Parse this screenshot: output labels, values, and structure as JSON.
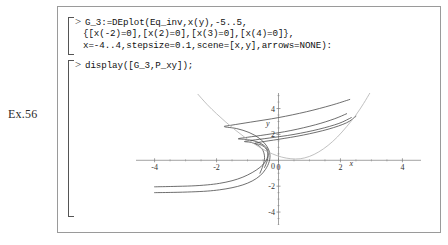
{
  "exercise": {
    "label": "Ex.56"
  },
  "worksheet": {
    "groups": [
      {
        "prompt": ">",
        "lines": [
          "G_3:=DEplot(Eq_inv,x(y),-5..5,",
          "{[x(-2)=0],[x(2)=0],[x(3)=0],[x(4)=0]},",
          "x=-4..4,stepsize=0.1,scene=[x,y],arrows=NONE):"
        ]
      },
      {
        "prompt": ">",
        "lines": [
          "display([G_3,P_xy]);"
        ]
      }
    ]
  },
  "chart_data": {
    "type": "line",
    "title": "",
    "xlabel": "x",
    "ylabel": "y",
    "xlim": [
      -4.6,
      4.6
    ],
    "ylim": [
      -5.0,
      5.2
    ],
    "grid": false,
    "legend": "none",
    "xticks": [
      -4,
      -2,
      0,
      2,
      4
    ],
    "xtick_labels": [
      "-4",
      "-2",
      "0",
      "2",
      "4"
    ],
    "yticks": [
      -4,
      -2,
      2,
      4
    ],
    "ytick_labels": [
      "-4",
      "-2",
      "2",
      "4"
    ],
    "axis_color": "#7a7a7a",
    "curve_color": "#4a4a4a",
    "highlight_color": "#b0b0b0",
    "series": [
      {
        "name": "x(-2)=0",
        "color": "#4a4a4a",
        "points": [
          [
            -4.0,
            -2.05
          ],
          [
            -3.4,
            -2.02
          ],
          [
            -2.8,
            -1.98
          ],
          [
            -2.3,
            -1.9
          ],
          [
            -1.9,
            -1.78
          ],
          [
            -1.5,
            -1.58
          ],
          [
            -1.15,
            -1.3
          ],
          [
            -0.85,
            -0.95
          ],
          [
            -0.6,
            -0.55
          ],
          [
            -0.42,
            -0.1
          ],
          [
            -0.34,
            0.4
          ],
          [
            -0.36,
            0.85
          ],
          [
            -0.5,
            1.2
          ],
          [
            -0.72,
            1.45
          ],
          [
            -1.0,
            1.6
          ],
          [
            -1.3,
            1.66
          ],
          [
            -1.0,
            1.78
          ],
          [
            -0.4,
            1.98
          ],
          [
            0.4,
            2.3
          ],
          [
            1.2,
            2.75
          ],
          [
            1.8,
            3.2
          ],
          [
            2.2,
            3.6
          ]
        ]
      },
      {
        "name": "x(2)=0",
        "color": "#4a4a4a",
        "points": [
          [
            -4.0,
            -2.5
          ],
          [
            -3.4,
            -2.48
          ],
          [
            -2.8,
            -2.44
          ],
          [
            -2.3,
            -2.38
          ],
          [
            -1.9,
            -2.28
          ],
          [
            -1.5,
            -2.12
          ],
          [
            -1.15,
            -1.9
          ],
          [
            -0.85,
            -1.6
          ],
          [
            -0.6,
            -1.2
          ],
          [
            -0.42,
            -0.7
          ],
          [
            -0.3,
            -0.1
          ],
          [
            -0.28,
            0.5
          ],
          [
            -0.38,
            1.1
          ],
          [
            -0.62,
            1.7
          ],
          [
            -0.95,
            2.15
          ],
          [
            -1.35,
            2.45
          ],
          [
            -1.75,
            2.6
          ],
          [
            -1.5,
            2.72
          ],
          [
            -0.9,
            2.95
          ],
          [
            0.0,
            3.3
          ],
          [
            0.9,
            3.75
          ],
          [
            1.7,
            4.25
          ],
          [
            2.3,
            4.7
          ]
        ]
      },
      {
        "name": "x(3)=0",
        "color": "#4a4a4a",
        "points": [
          [
            -0.6,
            -1.0
          ],
          [
            -0.5,
            -0.4
          ],
          [
            -0.45,
            0.2
          ],
          [
            -0.5,
            0.75
          ],
          [
            -0.65,
            1.15
          ],
          [
            -0.88,
            1.38
          ],
          [
            -1.1,
            1.45
          ],
          [
            -0.85,
            1.55
          ],
          [
            -0.3,
            1.72
          ],
          [
            0.5,
            2.0
          ],
          [
            1.3,
            2.4
          ],
          [
            1.95,
            2.85
          ],
          [
            2.35,
            3.3
          ]
        ]
      },
      {
        "name": "x(4)=0",
        "color": "#4a4a4a",
        "points": [
          [
            -0.45,
            -0.55
          ],
          [
            -0.36,
            0.0
          ],
          [
            -0.34,
            0.5
          ],
          [
            -0.42,
            0.95
          ],
          [
            -0.6,
            1.22
          ],
          [
            -0.78,
            1.3
          ],
          [
            -0.55,
            1.42
          ],
          [
            0.0,
            1.62
          ],
          [
            0.8,
            1.95
          ],
          [
            1.6,
            2.4
          ],
          [
            2.2,
            2.9
          ],
          [
            2.5,
            3.4
          ]
        ]
      },
      {
        "name": "P_xy",
        "color": "#b0b0b0",
        "points": [
          [
            -2.6,
            5.1
          ],
          [
            -2.3,
            4.3
          ],
          [
            -2.0,
            3.6
          ],
          [
            -1.7,
            2.95
          ],
          [
            -1.4,
            2.35
          ],
          [
            -1.1,
            1.8
          ],
          [
            -0.8,
            1.3
          ],
          [
            -0.5,
            0.85
          ],
          [
            -0.2,
            0.5
          ],
          [
            0.1,
            0.25
          ],
          [
            0.4,
            0.12
          ],
          [
            0.7,
            0.12
          ],
          [
            1.0,
            0.3
          ],
          [
            1.3,
            0.65
          ],
          [
            1.6,
            1.15
          ],
          [
            1.9,
            1.8
          ],
          [
            2.2,
            2.6
          ],
          [
            2.5,
            3.5
          ],
          [
            2.75,
            4.4
          ],
          [
            2.95,
            5.2
          ]
        ]
      }
    ],
    "annotations": [
      {
        "text": "x",
        "x": 2.35,
        "y": -0.45
      },
      {
        "text": "y",
        "x": -0.35,
        "y": 2.65
      }
    ]
  }
}
